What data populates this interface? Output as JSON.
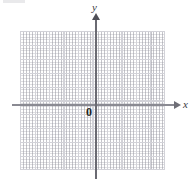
{
  "figure": {
    "kind": "cartesian-coordinate-grid",
    "width": 195,
    "height": 179,
    "background": "#ffffff"
  },
  "axes": {
    "x_label": "x",
    "y_label": "y",
    "origin_label": "0",
    "axis_color": "#8a8a92",
    "x_has_arrow": true,
    "y_has_arrow": true,
    "x_arrow_direction": "right",
    "y_arrow_direction": "up"
  },
  "grid": {
    "major_columns": 10,
    "major_rows": 10,
    "major_line_color": "#d2d2d8",
    "minor_line_color": "#969aa0",
    "minor_style": "dotted",
    "minor_per_major": 5,
    "tick_labels_shown": false,
    "plot_left": 20,
    "plot_top": 31,
    "plot_width": 145,
    "plot_height": 139,
    "origin_x": 95,
    "origin_y": 104
  },
  "chart_data": {
    "type": "scatter",
    "title": "",
    "xlabel": "x",
    "ylabel": "y",
    "series": [],
    "x": [],
    "values": [],
    "xlim": [
      -5,
      5
    ],
    "ylim": [
      -5,
      5
    ],
    "grid": true,
    "legend": "none",
    "annotations": [
      "0"
    ],
    "note": "Empty blank coordinate plane; no data plotted."
  }
}
